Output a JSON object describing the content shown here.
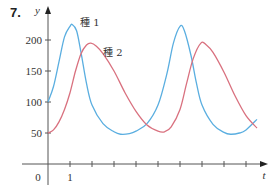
{
  "problem_number": "7.",
  "chart_data": {
    "type": "line",
    "title": "",
    "xlabel": "t",
    "ylabel": "y",
    "xlim": [
      0,
      9.8
    ],
    "ylim": [
      0,
      230
    ],
    "x_ticks": [
      0,
      1,
      2,
      3,
      4,
      5,
      6,
      7,
      8,
      9
    ],
    "x_tick_labels": [
      "0",
      "1"
    ],
    "y_ticks": [
      50,
      100,
      150,
      200
    ],
    "y_tick_labels": [
      "50",
      "100",
      "150",
      "200"
    ],
    "grid": false,
    "legend_position": "inline annotations near peaks",
    "series": [
      {
        "name": "種 1",
        "color": "#5aaee0",
        "x": [
          0,
          0.25,
          0.5,
          0.75,
          1.0,
          1.1,
          1.3,
          1.5,
          1.75,
          2.0,
          2.5,
          3.0,
          3.3,
          3.7,
          4.0,
          4.5,
          5.0,
          5.4,
          5.7,
          6.0,
          6.2,
          6.5,
          6.75,
          7.0,
          7.5,
          8.0,
          8.3,
          8.7,
          9.0,
          9.5
        ],
        "values": [
          100,
          125,
          165,
          205,
          222,
          225,
          215,
          180,
          130,
          95,
          65,
          52,
          48,
          49,
          53,
          65,
          95,
          145,
          195,
          222,
          215,
          175,
          130,
          95,
          64,
          51,
          48,
          50,
          55,
          72
        ]
      },
      {
        "name": "種 2",
        "color": "#d9717f",
        "x": [
          0,
          0.25,
          0.5,
          0.75,
          1.0,
          1.25,
          1.5,
          1.75,
          1.95,
          2.2,
          2.5,
          3.0,
          3.5,
          4.0,
          4.5,
          5.0,
          5.3,
          5.6,
          6.0,
          6.3,
          6.6,
          6.95,
          7.2,
          7.5,
          8.0,
          8.5,
          9.0,
          9.5
        ],
        "values": [
          50,
          55,
          68,
          88,
          115,
          150,
          178,
          192,
          195,
          190,
          178,
          150,
          115,
          85,
          63,
          53,
          52,
          60,
          88,
          130,
          170,
          195,
          192,
          180,
          148,
          110,
          78,
          58
        ]
      }
    ]
  },
  "labels": {
    "y_axis": "y",
    "x_axis": "t",
    "origin": "0",
    "series1": "種 1",
    "series2": "種 2"
  }
}
